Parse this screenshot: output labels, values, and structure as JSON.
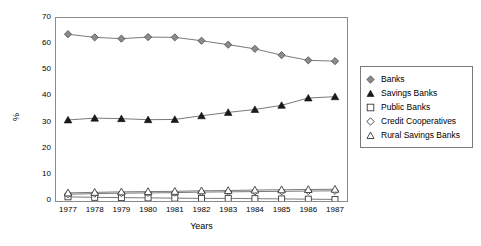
{
  "chart_data": {
    "type": "line",
    "title": "",
    "xlabel": "Years",
    "ylabel": "%",
    "categories": [
      "1977",
      "1978",
      "1979",
      "1980",
      "1981",
      "1982",
      "1983",
      "1984",
      "1985",
      "1986",
      "1987"
    ],
    "x": [
      1977,
      1978,
      1979,
      1980,
      1981,
      1982,
      1983,
      1984,
      1985,
      1986,
      1987
    ],
    "ylim": [
      0,
      70
    ],
    "yticks": [
      0,
      10,
      20,
      30,
      40,
      50,
      60,
      70
    ],
    "grid": false,
    "legend_position": "right",
    "series": [
      {
        "name": "Banks",
        "marker": "diamond-filled",
        "values": [
          63.8,
          62.6,
          62.1,
          62.7,
          62.6,
          61.3,
          59.8,
          58.2,
          55.8,
          53.8,
          53.5
        ]
      },
      {
        "name": "Savings Banks",
        "marker": "triangle-filled",
        "values": [
          31.0,
          31.7,
          31.5,
          31.1,
          31.2,
          32.6,
          33.9,
          35.0,
          36.6,
          39.4,
          39.9
        ]
      },
      {
        "name": "Public Banks",
        "marker": "square-open",
        "values": [
          1.6,
          1.4,
          1.3,
          1.2,
          1.1,
          1.0,
          1.0,
          0.9,
          0.8,
          0.7,
          0.6
        ]
      },
      {
        "name": "Credit Cooperatives",
        "marker": "diamond-open",
        "values": [
          2.6,
          2.8,
          3.0,
          3.1,
          3.2,
          3.4,
          3.5,
          3.6,
          3.7,
          3.8,
          3.9
        ]
      },
      {
        "name": "Rural Savings Banks",
        "marker": "triangle-open",
        "values": [
          3.1,
          3.3,
          3.5,
          3.6,
          3.7,
          3.9,
          4.0,
          4.2,
          4.3,
          4.4,
          4.5
        ]
      }
    ]
  },
  "axes": {
    "y_title": "%",
    "x_title": "Years",
    "y_ticks": [
      "0",
      "10",
      "20",
      "30",
      "40",
      "50",
      "60",
      "70"
    ],
    "x_ticks": [
      "1977",
      "1978",
      "1979",
      "1980",
      "1981",
      "1982",
      "1983",
      "1984",
      "1985",
      "1986",
      "1987"
    ]
  },
  "legend": {
    "items": [
      {
        "label": "Banks",
        "marker": "diamond-filled-icon"
      },
      {
        "label": "Savings Banks",
        "marker": "triangle-filled-icon"
      },
      {
        "label": "Public Banks",
        "marker": "square-open-icon"
      },
      {
        "label": "Credit Cooperatives",
        "marker": "diamond-open-icon"
      },
      {
        "label": "Rural Savings Banks",
        "marker": "triangle-open-icon"
      }
    ]
  },
  "colors": {
    "line": "#6b6b6b",
    "marker_fill_dark": "#8c8c8c",
    "marker_fill_black": "#1a1a1a",
    "marker_stroke": "#3a3a3a",
    "frame": "#8a8a8a",
    "background": "#ffffff"
  }
}
